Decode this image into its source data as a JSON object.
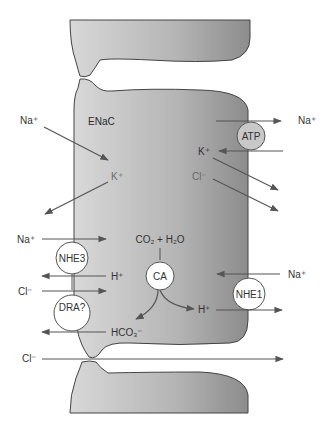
{
  "figure": {
    "type": "epithelial cell ion transport diagram",
    "colors": {
      "cell_fill_light": "#d6d6d6",
      "cell_fill_dark": "#8e8e8e",
      "outline": "#444444",
      "arrow": "#555555",
      "transporter_fill": "#ffffff",
      "atp_fill": "#c8c8c8"
    }
  },
  "labels": {
    "channel": "ENaC",
    "na_apical_in": "Na⁺",
    "na_basolateral_out": "Na⁺",
    "k_basolateral_in": "K⁺",
    "k_apical": "K⁺",
    "cl_basolateral": "Cl⁻",
    "na_nhe3": "Na⁺",
    "h_nhe3": "H⁺",
    "cl_dra": "Cl⁻",
    "hco3_dra": "HCO₃⁻",
    "co2_h2o": "CO₂ + H₂O",
    "h_ca": "H⁺",
    "na_nhe1": "Na⁺",
    "cl_paracellular": "Cl⁻"
  },
  "transporters": {
    "atp": "ATP",
    "nhe3": "NHE3",
    "ca": "CA",
    "nhe1": "NHE1",
    "dra_line1": "DRA?",
    "dra_line2": "AE1?"
  }
}
